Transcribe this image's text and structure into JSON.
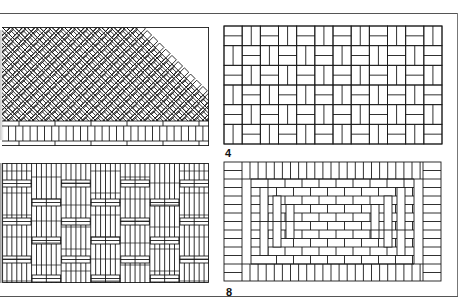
{
  "page": {
    "colors": {
      "line": "#1a1a1a",
      "paper": "#ffffff",
      "frame": "#555555"
    }
  },
  "figures": [
    {
      "id": "herringbone",
      "label": "",
      "pattern": "45-degree herringbone with soldier-course border"
    },
    {
      "id": "basketweave",
      "label": "4",
      "pattern": "basketweave (pairs of bricks alternating horizontal/vertical)"
    },
    {
      "id": "woven",
      "label": "",
      "pattern": "woven stack bond with horizontal crossing bands"
    },
    {
      "id": "framed-running-bond",
      "label": "8",
      "pattern": "concentric frames of running bond with soldier and stretcher borders"
    }
  ]
}
